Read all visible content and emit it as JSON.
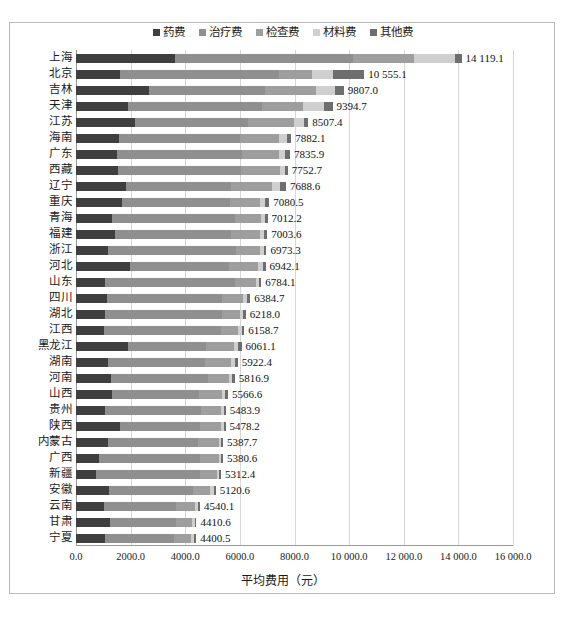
{
  "chart_data": {
    "type": "bar",
    "orientation": "horizontal",
    "stacked": true,
    "title": "",
    "xlabel": "平均费用（元）",
    "ylabel": "",
    "xlim": [
      0,
      16000
    ],
    "xticks": [
      "0.0",
      "2000.0",
      "4000.0",
      "6000.0",
      "8000.0",
      "10 000.0",
      "12 000.0",
      "14 000.0",
      "16 000.0"
    ],
    "xtick_values": [
      0,
      2000,
      4000,
      6000,
      8000,
      10000,
      12000,
      14000,
      16000
    ],
    "grid": true,
    "legend_position": "top",
    "categories": [
      "上海",
      "北京",
      "吉林",
      "天津",
      "江苏",
      "海南",
      "广东",
      "西藏",
      "辽宁",
      "重庆",
      "青海",
      "福建",
      "浙江",
      "河北",
      "山东",
      "四川",
      "湖北",
      "江西",
      "黑龙江",
      "湖南",
      "河南",
      "山西",
      "贵州",
      "陕西",
      "内蒙古",
      "广西",
      "新疆",
      "安徽",
      "云南",
      "甘肃",
      "宁夏"
    ],
    "totals": [
      14119.1,
      10555.1,
      9807.0,
      9394.7,
      8507.4,
      7882.1,
      7835.9,
      7752.7,
      7688.6,
      7080.5,
      7012.2,
      7003.6,
      6973.3,
      6942.1,
      6784.1,
      6384.7,
      6218.0,
      6158.7,
      6061.1,
      5922.4,
      5816.9,
      5566.6,
      5483.9,
      5478.2,
      5387.7,
      5380.6,
      5312.4,
      5120.6,
      4540.1,
      4410.6,
      4400.5
    ],
    "total_labels": [
      "14 119.1",
      "10 555.1",
      "9807.0",
      "9394.7",
      "8507.4",
      "7882.1",
      "7835.9",
      "7752.7",
      "7688.6",
      "7080.5",
      "7012.2",
      "7003.6",
      "6973.3",
      "6942.1",
      "6784.1",
      "6384.7",
      "6218.0",
      "6158.7",
      "6061.1",
      "5922.4",
      "5816.9",
      "5566.6",
      "5483.9",
      "5478.2",
      "5387.7",
      "5380.6",
      "5312.4",
      "5120.6",
      "4540.1",
      "4410.6",
      "4400.5"
    ],
    "series": [
      {
        "name": "药费",
        "color": "#3f3f3f",
        "values": [
          3620.0,
          1620.0,
          2670.0,
          1900.0,
          2150.0,
          1580.0,
          1490.0,
          1520.0,
          1830.0,
          1700.0,
          1300.0,
          1420.0,
          1160.0,
          1960.0,
          1080.0,
          1120.0,
          1060.0,
          1010.0,
          1900.0,
          1180.0,
          1280.0,
          1320.0,
          1060.0,
          1620.0,
          1160.0,
          860.0,
          740.0,
          1220.0,
          1040.0,
          1260.0,
          1060.0
        ]
      },
      {
        "name": "治疗费",
        "color": "#8f8f8f",
        "values": [
          6540.0,
          5820.0,
          4250.0,
          4900.0,
          4150.0,
          4420.0,
          4580.0,
          4520.0,
          3860.0,
          3950.0,
          4530.0,
          4240.0,
          4700.0,
          3640.0,
          4760.0,
          4240.0,
          4300.0,
          4300.0,
          2860.0,
          3540.0,
          3540.0,
          3200.0,
          3520.0,
          2920.0,
          3320.0,
          3680.0,
          3800.0,
          3050.0,
          2620.0,
          2410.0,
          2520.0
        ]
      },
      {
        "name": "检查费",
        "color": "#9e9e9e",
        "values": [
          2200.0,
          1200.0,
          1880.0,
          1520.0,
          1680.0,
          1450.0,
          1370.0,
          1420.0,
          1480.0,
          1080.0,
          960.0,
          1080.0,
          860.0,
          1060.0,
          760.0,
          740.0,
          660.0,
          640.0,
          1010.0,
          940.0,
          790.0,
          820.0,
          740.0,
          760.0,
          740.0,
          700.0,
          620.0,
          640.0,
          680.0,
          580.0,
          640.0
        ]
      },
      {
        "name": "材料费",
        "color": "#cfcfcf",
        "values": [
          1500.0,
          760.0,
          700.0,
          770.0,
          380.0,
          290.0,
          230.0,
          200.0,
          290.0,
          200.0,
          130.0,
          150.0,
          160.0,
          180.0,
          100.0,
          180.0,
          110.0,
          140.0,
          150.0,
          170.0,
          120.0,
          130.0,
          90.0,
          110.0,
          100.0,
          80.0,
          80.0,
          130.0,
          130.0,
          90.0,
          110.0
        ]
      },
      {
        "name": "其他费",
        "color": "#6e6e6e",
        "values": [
          259.1,
          1155.1,
          307.0,
          304.7,
          147.4,
          142.1,
          165.9,
          92.7,
          228.6,
          150.5,
          92.2,
          113.6,
          93.3,
          102.1,
          84.1,
          104.7,
          88.0,
          68.7,
          141.1,
          92.4,
          86.9,
          96.6,
          73.9,
          68.2,
          67.7,
          60.6,
          72.4,
          80.6,
          70.1,
          70.6,
          70.5
        ]
      }
    ]
  },
  "caption": {
    "text": ""
  }
}
